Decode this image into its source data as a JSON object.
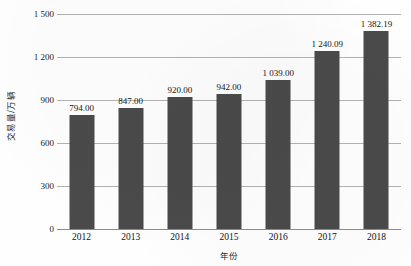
{
  "chart_data": {
    "type": "bar",
    "title": "",
    "xlabel": "年份",
    "ylabel": "交易量/万辆",
    "categories": [
      "2012",
      "2013",
      "2014",
      "2015",
      "2016",
      "2017",
      "2018"
    ],
    "values": [
      794.0,
      847.0,
      920.0,
      942.0,
      1039.0,
      1240.09,
      1382.19
    ],
    "value_labels": [
      "794.00",
      "847.00",
      "920.00",
      "942.00",
      "1 039.00",
      "1 240.09",
      "1 382.19"
    ],
    "ylim": [
      0,
      1500
    ],
    "ytick_values": [
      0,
      300,
      600,
      900,
      1200,
      1500
    ],
    "ytick_labels": [
      "0",
      "300",
      "600",
      "900",
      "1 200",
      "1 500"
    ],
    "grid": true,
    "legend": "none",
    "series": [
      {
        "name": "交易量",
        "values": [
          794.0,
          847.0,
          920.0,
          942.0,
          1039.0,
          1240.09,
          1382.19
        ]
      }
    ],
    "colors": {
      "bar": "#4a4a4a",
      "gridline": "#b3b3b3",
      "axis": "#8c8c8c",
      "text": "#141414",
      "background": "#fefefe"
    }
  }
}
